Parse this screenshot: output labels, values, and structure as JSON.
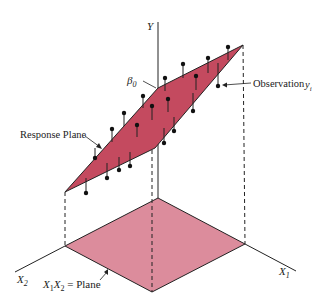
{
  "diagram": {
    "labels": {
      "y_axis": "Y",
      "beta0": "β",
      "beta0_sub": "0",
      "observation": "Observation",
      "observation_var": "y",
      "observation_sub": "i",
      "response_plane": "Response Plane",
      "x1_axis": "X",
      "x1_sub": "1",
      "x2_axis": "X",
      "x2_sub": "2",
      "base_plane_a": "X",
      "base_plane_a_sub": "1",
      "base_plane_b": "X",
      "base_plane_b_sub": "2",
      "base_plane_eq": " = Plane"
    },
    "colors": {
      "response_plane": "#c44a5f",
      "base_plane": "#dc8c9c",
      "lines": "#222222"
    },
    "response_plane_corners": [
      [
        158,
        88
      ],
      [
        243,
        45
      ],
      [
        155,
        148
      ],
      [
        65,
        192
      ]
    ],
    "base_plane_corners": [
      [
        158,
        198
      ],
      [
        245,
        244
      ],
      [
        152,
        292
      ],
      [
        65,
        246
      ]
    ],
    "observations": [
      {
        "dot": [
          228,
          47
        ],
        "plane": [
          228,
          60
        ]
      },
      {
        "dot": [
          208,
          58
        ],
        "plane": [
          208,
          73
        ]
      },
      {
        "dot": [
          183,
          64
        ],
        "plane": [
          183,
          78
        ]
      },
      {
        "dot": [
          165,
          78
        ],
        "plane": [
          165,
          91
        ]
      },
      {
        "dot": [
          143,
          96
        ],
        "plane": [
          143,
          108
        ]
      },
      {
        "dot": [
          124,
          113
        ],
        "plane": [
          124,
          126
        ]
      },
      {
        "dot": [
          112,
          129
        ],
        "plane": [
          112,
          142
        ]
      },
      {
        "dot": [
          95,
          158
        ],
        "plane": [
          95,
          148
        ]
      },
      {
        "dot": [
          196,
          76
        ],
        "plane": [
          196,
          90
        ]
      },
      {
        "dot": [
          168,
          99
        ],
        "plane": [
          168,
          112
        ]
      },
      {
        "dot": [
          152,
          106
        ],
        "plane": [
          152,
          120
        ]
      },
      {
        "dot": [
          137,
          125
        ],
        "plane": [
          137,
          137
        ]
      },
      {
        "dot": [
          218,
          86
        ],
        "plane": [
          218,
          63
        ]
      },
      {
        "dot": [
          193,
          111
        ],
        "plane": [
          193,
          93
        ]
      },
      {
        "dot": [
          174,
          131
        ],
        "plane": [
          174,
          117
        ]
      },
      {
        "dot": [
          164,
          143
        ],
        "plane": [
          164,
          128
        ]
      },
      {
        "dot": [
          130,
          166
        ],
        "plane": [
          130,
          152
        ]
      },
      {
        "dot": [
          119,
          170
        ],
        "plane": [
          119,
          157
        ]
      },
      {
        "dot": [
          107,
          178
        ],
        "plane": [
          107,
          163
        ]
      },
      {
        "dot": [
          86,
          193
        ],
        "plane": [
          86,
          178
        ]
      }
    ]
  }
}
